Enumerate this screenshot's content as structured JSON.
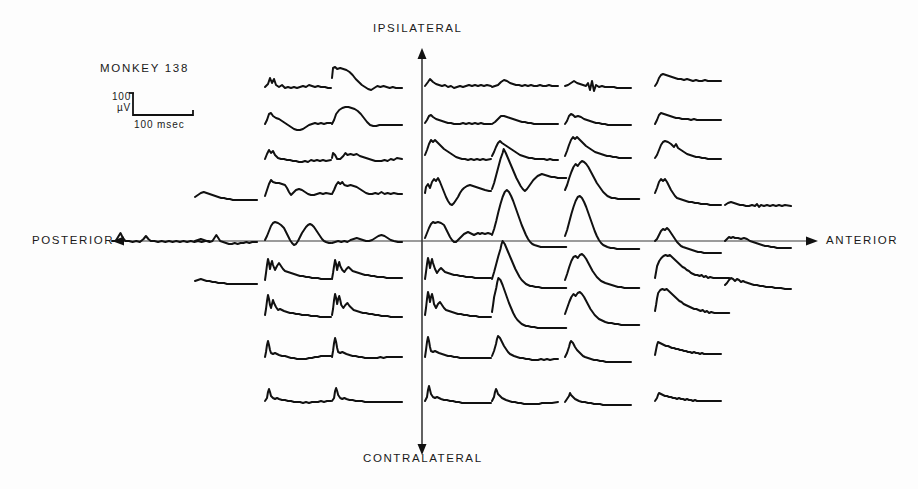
{
  "figure": {
    "subject_label": "MONKEY  138",
    "background_color": "#fdfdfd",
    "ink_color": "#111111",
    "axis_color": "#3a3a3a"
  },
  "axes": {
    "vertical": {
      "top_label": "IPSILATERAL",
      "bottom_label": "CONTRALATERAL",
      "x": 422,
      "y_top": 48,
      "y_bottom": 455
    },
    "horizontal": {
      "left_label": "POSTERIOR",
      "right_label": "ANTERIOR",
      "y": 241,
      "x_left": 112,
      "x_right": 818
    }
  },
  "calibration": {
    "amplitude_label": "100\nµV",
    "amplitude_value": 100,
    "amplitude_unit": "µV",
    "time_label": "100  msec",
    "time_value": 100,
    "time_unit": "msec",
    "corner_x": 133,
    "top_y": 93,
    "base_y": 115,
    "end_x": 193
  },
  "chart_data": {
    "type": "line",
    "title": "MONKEY  138",
    "xlabel": "POSTERIOR ← → ANTERIOR",
    "ylabel": "CONTRALATERAL ← → IPSILATERAL",
    "grid": false,
    "legend": null,
    "trace_duration_msec": 100,
    "amplitude_calibration_uv": 100,
    "columns": 8,
    "rows": 9,
    "row_baselines": [
      85,
      122,
      158,
      196,
      241,
      280,
      318,
      357,
      400
    ],
    "column_starts": [
      112,
      195,
      265,
      332,
      425,
      492,
      565,
      655,
      725
    ],
    "column_width": 64,
    "traces": [
      {
        "row": 0,
        "col": 2,
        "x": 265,
        "y": 85,
        "w": 66,
        "pts": "0,2 3,-1 5,-7 7,-2 9,-6 11,0 14,2 17,0 20,3 23,2 26,3 29,2 32,3 35,2 38,1 41,2 44,0 47,1 50,2 53,1 56,2 60,2 63,3 66,3"
      },
      {
        "row": 0,
        "col": 3,
        "x": 332,
        "y": 78,
        "w": 68,
        "pts": "0,0 1,-10 3,-11 5,-9 8,-10 11,-9 14,-8 17,-6 20,-3 23,1 26,4 29,7 32,9 35,11 38,12 41,10 44,8 47,9 50,8 53,9 56,10 59,9 62,10 65,10 68,10"
      },
      {
        "row": 0,
        "col": 4,
        "x": 425,
        "y": 85,
        "w": 66,
        "pts": "0,1 3,-3 5,-6 8,-3 11,-1 14,0 17,1 20,0 23,2 26,1 29,3 32,2 35,1 38,2 41,1 44,0 47,1 50,0 53,1 56,0 59,1 62,0 66,1"
      },
      {
        "row": 0,
        "col": 5,
        "x": 492,
        "y": 85,
        "w": 66,
        "pts": "0,2 3,1 6,0 9,-3 12,-5 15,-4 18,-2 21,-1 24,0 27,0 30,1 33,0 36,1 39,0 42,1 45,1 48,0 51,1 54,1 57,0 60,1 63,1 66,1"
      },
      {
        "row": 0,
        "col": 6,
        "x": 565,
        "y": 85,
        "w": 66,
        "pts": "0,1 3,0 6,-2 9,-4 12,-2 15,-1 18,0 21,1 23,-2 25,5 27,-4 29,6 31,0 34,2 37,1 40,2 43,2 46,2 49,2 52,3 55,3 58,3 61,3 66,3"
      },
      {
        "row": 0,
        "col": 7,
        "x": 655,
        "y": 82,
        "w": 66,
        "pts": "0,4 2,1 4,-4 6,-7 8,-8 11,-7 14,-6 17,-5 20,-4 23,-3 26,-3 29,-2 32,-3 35,-2 38,-1 41,-2 44,-1 47,-1 50,-2 53,-1 56,-1 59,-1 62,-1 66,-1"
      },
      {
        "row": 1,
        "col": 2,
        "x": 265,
        "y": 122,
        "w": 66,
        "pts": "0,2 2,-2 4,-8 6,-9 8,-6 11,-4 14,-3 17,-1 20,1 23,3 26,5 29,7 32,8 35,8 38,7 41,5 44,3 47,2 50,1 53,2 56,1 59,2 62,1 66,1"
      },
      {
        "row": 1,
        "col": 3,
        "x": 332,
        "y": 118,
        "w": 68,
        "pts": "0,6 2,2 4,-4 7,-8 10,-10 13,-11 16,-11 19,-10 22,-9 25,-7 28,-4 31,0 34,4 37,7 40,8 43,8 46,7 49,7 52,7 55,7 58,7 61,7 64,7 68,7"
      },
      {
        "row": 1,
        "col": 4,
        "x": 425,
        "y": 122,
        "w": 66,
        "pts": "0,1 2,-2 4,-6 6,-7 8,-5 11,-3 14,-2 17,-1 20,0 23,1 26,1 29,2 32,2 35,2 38,1 41,2 44,1 47,2 50,1 53,2 56,1 59,2 62,2 66,2"
      },
      {
        "row": 1,
        "col": 5,
        "x": 492,
        "y": 122,
        "w": 66,
        "pts": "0,2 3,0 6,-3 9,-6 12,-6 15,-5 18,-4 21,-3 24,-2 27,-1 30,0 33,0 36,1 39,1 42,2 45,2 48,2 51,2 54,2 57,2 60,2 63,2 66,2"
      },
      {
        "row": 1,
        "col": 6,
        "x": 565,
        "y": 122,
        "w": 66,
        "pts": "0,2 2,-1 4,-6 6,-8 8,-7 10,-5 13,-6 16,-5 19,-3 22,-2 25,-1 28,0 31,1 34,1 37,2 40,2 43,3 46,3 49,3 52,3 55,3 58,3 61,3 66,3"
      },
      {
        "row": 1,
        "col": 7,
        "x": 655,
        "y": 122,
        "w": 66,
        "pts": "0,2 2,-2 4,-7 6,-9 9,-8 12,-7 15,-6 18,-5 21,-4 24,-4 27,-3 30,-3 33,-3 36,-2 39,-3 42,-2 45,-2 48,-2 51,-2 54,-2 57,-2 60,-2 66,-2"
      },
      {
        "row": 2,
        "col": 2,
        "x": 265,
        "y": 158,
        "w": 66,
        "pts": "0,1 2,-4 4,-8 6,-5 8,-7 10,-3 13,0 16,1 19,1 22,2 25,2 28,3 31,3 34,4 37,4 40,3 43,4 46,2 49,3 52,2 55,3 58,2 61,3 66,2"
      },
      {
        "row": 2,
        "col": 3,
        "x": 332,
        "y": 158,
        "w": 68,
        "pts": "0,0 1,-5 3,-3 5,1 8,1 11,-2 13,-5 15,-3 18,-4 21,-3 24,-4 27,-2 30,-1 33,0 36,1 39,2 42,3 45,3 48,3 51,2 54,3 57,1 60,2 63,0 68,1"
      },
      {
        "row": 2,
        "col": 4,
        "x": 425,
        "y": 152,
        "w": 66,
        "pts": "0,3 2,-2 4,-8 6,-12 8,-10 10,-12 13,-9 16,-6 19,-3 22,-1 25,1 28,3 31,5 34,6 37,7 40,7 43,8 46,7 49,8 52,7 55,8 58,7 61,8 66,7"
      },
      {
        "row": 2,
        "col": 5,
        "x": 492,
        "y": 152,
        "w": 66,
        "pts": "0,4 2,0 4,-5 6,-9 8,-11 10,-9 13,-7 16,-5 19,-3 22,-1 25,1 28,3 31,4 34,5 37,6 40,6 43,7 46,7 49,7 52,7 55,8 58,7 61,8 66,8"
      },
      {
        "row": 2,
        "col": 6,
        "x": 565,
        "y": 150,
        "w": 66,
        "pts": "0,6 2,1 4,-5 6,-10 8,-13 10,-11 12,-13 15,-10 18,-7 21,-4 24,-2 27,0 30,2 33,3 36,4 39,5 42,6 45,6 48,7 51,7 54,8 57,8 60,8 66,8"
      },
      {
        "row": 2,
        "col": 7,
        "x": 655,
        "y": 152,
        "w": 66,
        "pts": "0,6 2,3 4,-2 6,-7 8,-10 10,-11 13,-10 16,-8 19,-5 21,-8 23,-4 26,-2 29,0 32,2 35,3 38,4 41,5 44,5 47,6 50,6 53,7 56,7 59,7 66,7"
      },
      {
        "row": 3,
        "col": 1,
        "x": 195,
        "y": 196,
        "w": 64,
        "pts": "0,1 3,-1 6,-3 9,-4 12,-3 15,-2 18,-1 21,0 24,1 27,2 30,2 33,3 36,3 39,4 42,4 45,4 48,4 51,4 54,4 57,4 60,4 64,4"
      },
      {
        "row": 3,
        "col": 2,
        "x": 265,
        "y": 190,
        "w": 66,
        "pts": "0,6 2,0 4,-6 6,-10 8,-8 11,-7 14,-7 17,-6 20,-5 22,-2 24,2 26,5 28,3 31,0 34,-1 37,0 40,2 43,4 46,5 49,5 52,4 55,3 58,4 61,3 66,4"
      },
      {
        "row": 3,
        "col": 3,
        "x": 332,
        "y": 190,
        "w": 68,
        "pts": "0,4 2,0 4,-5 6,-8 8,-6 10,-8 12,-5 15,-4 18,-5 21,-4 24,-3 27,-1 30,1 33,3 36,4 39,4 42,3 45,4 48,2 51,4 54,3 57,4 60,3 64,4 68,4"
      },
      {
        "row": 3,
        "col": 4,
        "x": 425,
        "y": 190,
        "w": 66,
        "pts": "0,3 1,-3 3,-6 5,-2 7,-8 9,-11 11,-9 13,-12 15,-8 17,-3 19,2 21,7 23,11 25,14 27,15 29,13 31,10 33,7 35,3 37,0 39,-2 42,-4 45,-5 48,-4 51,-3 54,-2 57,-1 60,0 64,1 66,1"
      },
      {
        "row": 3,
        "col": 5,
        "x": 492,
        "y": 175,
        "w": 70,
        "pts": "0,14 2,8 4,0 6,-8 8,-16 10,-22 11,-26 13,-22 15,-17 17,-12 19,-7 21,-2 23,3 25,7 27,11 29,14 31,16 33,14 35,11 37,8 39,5 41,3 43,1 45,0 47,-1 50,0 53,1 56,2 59,2 62,3 66,3 70,3"
      },
      {
        "row": 3,
        "col": 6,
        "x": 565,
        "y": 180,
        "w": 70,
        "pts": "0,10 2,5 4,-2 6,-8 8,-13 10,-16 12,-14 14,-17 16,-19 18,-18 20,-16 22,-13 24,-9 26,-5 28,-1 30,3 32,6 34,9 36,12 38,14 40,16 42,17 44,18 47,18 50,19 53,19 56,19 59,19 62,19 66,19 70,19"
      },
      {
        "row": 3,
        "col": 7,
        "x": 655,
        "y": 190,
        "w": 66,
        "pts": "0,3 2,-2 4,-8 6,-11 8,-9 10,-11 12,-8 14,-4 16,0 18,3 20,6 22,8 25,9 28,10 31,11 34,12 37,12 40,13 43,13 46,14 49,14 52,14 55,15 58,15 61,15 66,15"
      },
      {
        "row": 3,
        "col": 8,
        "x": 725,
        "y": 205,
        "w": 66,
        "pts": "0,0 3,-2 6,-3 9,-2 12,-1 15,0 18,0 21,1 24,1 27,0 30,1 32,-1 34,2 36,0 39,1 42,0 45,1 48,0 51,1 54,0 57,1 60,0 66,1"
      },
      {
        "row": 4,
        "col": 0,
        "x": 112,
        "y": 241,
        "w": 80,
        "pts": "0,0 3,0 5,-4 7,-8 9,-3 11,0 14,0 17,1 20,0 23,1 26,-2 28,-5 30,-2 32,0 35,0 38,1 41,0 44,1 47,0 50,1 53,0 56,1 59,0 62,1 65,0 68,1 71,0 74,1 77,0 80,0"
      },
      {
        "row": 4,
        "col": 1,
        "x": 195,
        "y": 241,
        "w": 64,
        "pts": "0,0 3,-1 6,-2 9,-1 12,0 15,1 18,0 20,-3 22,-6 24,-3 26,0 29,1 32,2 35,3 38,3 41,2 44,3 47,2 50,2 53,1 56,2 59,1 64,1"
      },
      {
        "row": 4,
        "col": 2,
        "x": 265,
        "y": 232,
        "w": 66,
        "pts": "0,8 2,4 4,-1 6,-6 8,-9 10,-10 13,-9 16,-7 19,-4 21,0 23,4 25,8 27,11 29,13 31,12 33,9 35,5 37,1 39,-2 41,-5 43,-7 45,-8 47,-7 49,-5 51,-2 53,1 55,4 57,7 59,9 61,10 64,11 66,11"
      },
      {
        "row": 4,
        "col": 3,
        "x": 332,
        "y": 241,
        "w": 68,
        "pts": "0,2 3,1 6,0 9,1 12,0 15,1 18,-1 21,-2 24,-3 27,-2 30,-1 33,0 36,0 39,-1 42,-3 45,-5 48,-6 51,-5 54,-3 57,-1 60,0 64,1 68,1"
      },
      {
        "row": 4,
        "col": 4,
        "x": 425,
        "y": 232,
        "w": 66,
        "pts": "0,6 2,1 4,-4 6,-8 8,-10 10,-9 13,-10 16,-9 19,-7 21,-3 23,1 25,5 27,8 29,10 31,10 33,8 35,6 37,4 39,2 41,1 43,0 45,1 47,2 49,3 51,2 53,1 55,2 57,1 60,2 63,1 66,2"
      },
      {
        "row": 4,
        "col": 5,
        "x": 492,
        "y": 215,
        "w": 70,
        "pts": "0,20 2,14 4,6 6,-3 8,-11 10,-18 12,-23 14,-25 16,-23 18,-19 20,-14 22,-8 24,-2 26,4 28,10 30,15 32,20 34,24 36,27 38,29 40,30 43,31 46,32 49,32 52,32 55,32 58,32 61,32 65,32 70,32"
      },
      {
        "row": 4,
        "col": 6,
        "x": 565,
        "y": 218,
        "w": 70,
        "pts": "0,18 2,12 4,4 6,-4 8,-11 10,-17 12,-21 14,-22 16,-20 18,-16 20,-11 22,-5 24,1 26,7 28,13 30,18 32,22 34,25 36,27 38,28 40,29 43,30 46,30 49,31 52,31 55,31 58,31 62,31 66,31 70,31"
      },
      {
        "row": 4,
        "col": 7,
        "x": 655,
        "y": 241,
        "w": 66,
        "pts": "0,0 2,-2 4,-6 6,-10 8,-12 10,-11 12,-13 14,-11 16,-8 18,-5 20,-2 22,1 24,3 26,5 28,6 31,7 34,8 37,9 40,10 43,11 46,11 49,12 52,12 55,12 58,12 62,12 66,12"
      },
      {
        "row": 4,
        "col": 8,
        "x": 725,
        "y": 241,
        "w": 66,
        "pts": "0,0 2,-2 4,-4 6,-3 8,-4 10,-3 13,-3 16,-2 19,-3 22,-2 25,0 28,1 31,2 34,3 37,4 40,5 43,5 46,6 49,6 52,7 55,7 58,7 62,7 66,7"
      },
      {
        "row": 5,
        "col": 0,
        "x": 195,
        "y": 280,
        "w": 64,
        "pts": "0,1 3,0 6,-1 9,0 12,1 15,1 18,2 21,2 24,3 27,3 30,3 33,4 36,4 39,4 42,4 45,4 48,4 51,4 54,4 57,4 64,4"
      },
      {
        "row": 5,
        "col": 2,
        "x": 265,
        "y": 275,
        "w": 66,
        "pts": "0,5 1,-2 2,-10 3,-16 4,-12 5,-6 6,-11 7,-14 8,-10 10,-5 12,-9 14,-12 16,-9 18,-6 20,-4 23,-3 26,-2 29,-1 32,0 35,1 38,1 41,2 44,2 47,3 50,3 53,3 56,4 59,4 62,4 66,4"
      },
      {
        "row": 5,
        "col": 3,
        "x": 332,
        "y": 275,
        "w": 68,
        "pts": "0,4 1,-2 2,-9 3,-15 4,-11 5,-5 6,-10 7,-13 8,-9 10,-5 12,-3 14,-6 16,-8 18,-6 20,-4 23,-3 26,-2 29,-1 32,0 35,0 38,1 41,1 44,2 47,2 50,2 53,3 56,3 59,3 62,3 68,3"
      },
      {
        "row": 5,
        "col": 4,
        "x": 425,
        "y": 275,
        "w": 66,
        "pts": "0,4 1,-3 2,-11 3,-17 4,-13 5,-7 6,-12 7,-16 8,-12 10,-6 12,-2 14,-5 16,-7 18,-5 20,-3 23,-2 26,-1 29,0 32,0 35,1 38,1 41,2 44,2 47,2 50,3 53,3 56,3 59,3 66,3"
      },
      {
        "row": 5,
        "col": 5,
        "x": 492,
        "y": 262,
        "w": 70,
        "pts": "0,17 2,10 4,2 6,-6 8,-13 9,-18 10,-21 12,-18 14,-13 16,-8 18,-3 20,2 22,7 24,11 26,15 28,18 30,20 32,22 34,23 36,24 38,24 41,25 44,25 47,26 50,26 53,26 56,26 60,26 65,26 70,26"
      },
      {
        "row": 5,
        "col": 6,
        "x": 565,
        "y": 268,
        "w": 70,
        "pts": "0,12 2,6 4,-1 6,-7 8,-11 10,-12 12,-10 14,-13 16,-14 18,-12 20,-9 22,-5 24,-1 26,3 28,6 30,9 32,11 34,13 36,14 38,15 41,16 44,17 47,18 50,19 53,19 56,20 60,20 65,20 70,20"
      },
      {
        "row": 5,
        "col": 7,
        "x": 655,
        "y": 275,
        "w": 70,
        "pts": "0,3 1,-3 2,-9 4,-14 6,-17 8,-19 10,-20 12,-19 14,-20 16,-18 18,-16 20,-14 22,-12 24,-10 26,-8 28,-7 30,-5 32,-4 34,-2 36,-1 38,0 40,0 42,1 44,0 46,2 48,1 50,3 52,2 55,3 58,3 62,3 66,3 70,3"
      },
      {
        "row": 5,
        "col": 8,
        "x": 725,
        "y": 285,
        "w": 66,
        "pts": "0,0 2,-2 4,-5 6,-7 8,-6 10,-4 12,-6 14,-5 16,-3 18,-4 20,-3 23,-2 26,-1 29,0 32,0 35,1 38,1 41,2 44,2 47,2 50,3 53,3 56,3 60,4 66,4"
      },
      {
        "row": 6,
        "col": 2,
        "x": 265,
        "y": 312,
        "w": 66,
        "pts": "0,3 1,-3 2,-11 3,-17 4,-13 5,-7 6,-4 7,-8 8,-12 9,-9 11,-5 13,-2 15,-3 17,-2 19,-1 22,0 25,1 28,1 31,2 34,2 37,3 40,3 43,3 46,4 49,4 52,4 55,5 58,5 62,5 66,5"
      },
      {
        "row": 6,
        "col": 3,
        "x": 332,
        "y": 312,
        "w": 68,
        "pts": "0,3 1,-3 2,-12 3,-18 4,-14 5,-8 6,-13 7,-16 8,-12 9,-7 11,-4 13,-7 15,-9 17,-6 19,-4 21,-2 24,-1 27,0 30,1 33,1 36,2 39,2 42,3 45,3 48,4 51,4 54,4 57,5 62,5 68,5"
      },
      {
        "row": 6,
        "col": 4,
        "x": 425,
        "y": 312,
        "w": 66,
        "pts": "0,3 1,-4 2,-13 3,-20 4,-16 5,-10 6,-15 7,-18 8,-14 9,-8 11,-4 13,-8 15,-10 17,-7 19,-4 21,-2 24,-1 27,0 30,1 33,2 36,2 39,3 42,3 45,4 48,4 51,4 54,5 57,5 62,5 66,5"
      },
      {
        "row": 6,
        "col": 5,
        "x": 492,
        "y": 298,
        "w": 70,
        "pts": "0,14 1,7 2,-1 4,-10 5,-16 6,-20 8,-18 10,-13 12,-7 14,-1 16,5 18,10 20,15 22,19 24,22 26,24 28,26 30,27 32,28 34,28 37,29 40,29 43,30 46,30 49,30 52,30 56,30 60,30 65,30 70,30"
      },
      {
        "row": 6,
        "col": 6,
        "x": 565,
        "y": 305,
        "w": 70,
        "pts": "0,9 2,3 4,-3 6,-8 8,-11 10,-9 12,-12 14,-13 16,-11 18,-8 20,-4 22,0 24,4 26,7 28,10 30,12 32,14 34,15 36,16 38,17 41,18 44,18 47,19 50,19 53,20 56,20 60,20 65,20 70,20"
      },
      {
        "row": 6,
        "col": 7,
        "x": 655,
        "y": 305,
        "w": 70,
        "pts": "0,6 1,0 2,-7 3,-12 5,-15 7,-16 9,-15 11,-16 13,-14 15,-12 17,-10 19,-8 21,-6 23,-4 25,-3 27,-1 29,0 31,1 33,2 35,3 37,4 39,4 41,5 43,6 45,5 47,7 49,6 51,8 53,7 56,8 60,8 65,8 70,8"
      },
      {
        "row": 7,
        "col": 2,
        "x": 265,
        "y": 355,
        "w": 66,
        "pts": "0,2 1,-3 2,-10 3,-14 4,-10 5,-5 6,-2 8,-1 10,-2 12,-1 14,0 17,1 20,1 23,2 26,3 29,3 32,4 35,4 38,4 41,4 44,3 47,3 50,2 53,2 56,1 59,1 62,1 66,1"
      },
      {
        "row": 7,
        "col": 3,
        "x": 332,
        "y": 355,
        "w": 68,
        "pts": "0,2 1,-4 2,-12 3,-17 4,-13 5,-7 6,-3 8,-2 10,-3 12,-2 14,-1 17,0 20,1 23,1 26,2 29,2 32,3 35,3 38,3 41,3 44,3 47,2 50,3 53,2 56,2 59,2 62,2 68,2"
      },
      {
        "row": 7,
        "col": 4,
        "x": 425,
        "y": 355,
        "w": 66,
        "pts": "0,2 1,-5 2,-13 3,-18 4,-14 5,-8 6,-4 8,-3 10,-4 12,-3 14,-2 17,-1 20,0 23,1 26,1 29,2 32,2 35,3 38,3 41,3 44,3 47,3 50,3 53,3 56,3 60,3 66,3"
      },
      {
        "row": 7,
        "col": 5,
        "x": 492,
        "y": 348,
        "w": 66,
        "pts": "0,8 2,3 4,-4 5,-9 6,-12 8,-10 10,-6 12,-2 14,1 16,4 18,6 20,7 22,8 25,9 28,10 31,10 34,11 37,11 40,12 43,12 46,12 49,11 52,12 55,11 58,12 62,11 66,11"
      },
      {
        "row": 7,
        "col": 6,
        "x": 565,
        "y": 352,
        "w": 66,
        "pts": "0,5 2,1 4,-5 5,-9 6,-11 8,-9 10,-5 12,-2 14,0 16,2 18,4 20,5 23,6 26,7 29,8 32,8 35,9 38,9 41,10 44,10 47,10 50,10 53,10 56,10 60,10 66,10"
      },
      {
        "row": 7,
        "col": 7,
        "x": 655,
        "y": 352,
        "w": 66,
        "pts": "0,3 1,-2 2,-7 3,-10 5,-9 7,-8 9,-7 11,-6 13,-6 15,-5 17,-4 19,-4 21,-3 23,-3 25,-2 27,-2 29,-1 31,-1 33,0 35,0 37,1 39,0 41,1 43,1 45,2 47,1 49,2 52,2 56,2 60,2 66,2"
      },
      {
        "row": 8,
        "col": 2,
        "x": 265,
        "y": 400,
        "w": 66,
        "pts": "0,1 2,-2 3,-8 4,-11 5,-8 6,-4 8,-2 10,-1 12,-2 14,-1 17,0 20,0 23,1 26,1 29,2 32,2 35,2 38,3 41,2 44,3 47,2 50,2 53,2 56,1 59,2 62,1 66,1"
      },
      {
        "row": 8,
        "col": 3,
        "x": 332,
        "y": 400,
        "w": 68,
        "pts": "0,1 2,-2 3,-9 4,-12 5,-9 6,-5 8,-2 10,-1 12,-2 14,-1 17,0 20,0 23,1 26,1 29,1 32,2 35,2 38,2 41,2 44,2 47,2 50,2 53,2 56,2 59,2 62,2 68,2"
      },
      {
        "row": 8,
        "col": 4,
        "x": 425,
        "y": 400,
        "w": 66,
        "pts": "0,1 2,-3 3,-10 4,-14 5,-10 6,-6 8,-3 10,-2 12,-3 14,-2 16,-1 19,0 22,0 25,1 28,1 31,2 34,2 37,3 40,3 43,3 46,3 49,3 52,3 55,3 58,3 62,3 66,3"
      },
      {
        "row": 8,
        "col": 5,
        "x": 492,
        "y": 398,
        "w": 66,
        "pts": "0,3 2,-1 3,-6 4,-9 5,-7 6,-4 8,-2 10,0 12,1 14,2 17,3 20,4 23,4 26,5 29,5 32,6 35,6 38,6 41,6 44,6 47,6 50,5 53,5 56,5 60,5 66,4"
      },
      {
        "row": 8,
        "col": 6,
        "x": 565,
        "y": 400,
        "w": 66,
        "pts": "0,2 2,-1 4,-4 5,-7 6,-5 8,-3 10,-1 12,0 14,1 17,2 20,2 23,3 26,3 29,4 32,4 35,4 38,5 41,5 44,5 47,5 50,5 53,5 56,5 60,5 66,5"
      },
      {
        "row": 8,
        "col": 7,
        "x": 655,
        "y": 400,
        "w": 66,
        "pts": "0,1 2,-2 3,-5 4,-7 6,-6 8,-5 10,-4 12,-4 14,-3 16,-3 18,-2 20,-2 22,-1 24,-2 26,-1 28,-1 30,0 32,-1 34,0 36,0 38,1 40,0 42,1 44,1 47,1 50,1 54,1 58,1 66,1"
      }
    ]
  }
}
